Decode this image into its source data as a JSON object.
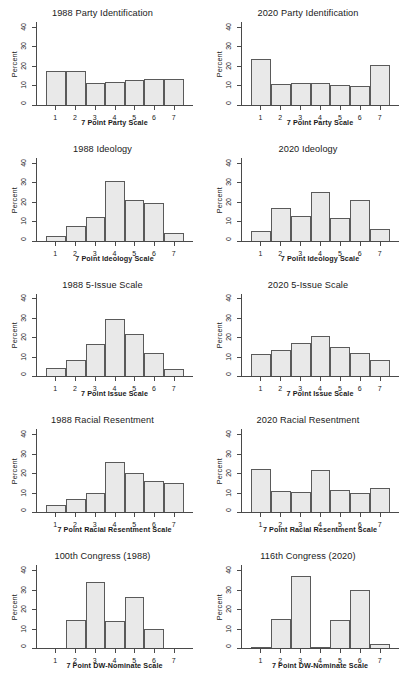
{
  "figure": {
    "ylabel": "Percent",
    "yticks": [
      0,
      10,
      20,
      30,
      40
    ],
    "ylim": [
      0,
      43
    ],
    "xticks": [
      1,
      2,
      3,
      4,
      5,
      6,
      7
    ],
    "bar_fill": "#e9e9e9",
    "bar_border": "#5a5a5a",
    "background": "#ffffff"
  },
  "chart_data": [
    {
      "type": "bar",
      "title": "1988 Party Identification",
      "xlabel": "7 Point Party Scale",
      "ylabel": "Percent",
      "categories": [
        1,
        2,
        3,
        4,
        5,
        6,
        7
      ],
      "values": [
        17.5,
        17.4,
        11.5,
        11.6,
        13.0,
        13.5,
        13.4
      ],
      "ylim": [
        0,
        43
      ],
      "grid": false,
      "legend": "none"
    },
    {
      "type": "bar",
      "title": "2020 Party Identification",
      "xlabel": "7 Point Party Scale",
      "ylabel": "Percent",
      "categories": [
        1,
        2,
        3,
        4,
        5,
        6,
        7
      ],
      "values": [
        23.6,
        11.0,
        11.5,
        11.4,
        10.5,
        9.8,
        20.6
      ],
      "ylim": [
        0,
        43
      ],
      "grid": false,
      "legend": "none"
    },
    {
      "type": "bar",
      "title": "1988 Ideology",
      "xlabel": "7 Point Ideology Scale",
      "ylabel": "Percent",
      "categories": [
        1,
        2,
        3,
        4,
        5,
        6,
        7
      ],
      "values": [
        2.2,
        7.6,
        12.5,
        31.0,
        21.3,
        19.4,
        4.0
      ],
      "ylim": [
        0,
        43
      ],
      "grid": false,
      "legend": "none"
    },
    {
      "type": "bar",
      "title": "2020 Ideology",
      "xlabel": "7 Point Ideology Scale",
      "ylabel": "Percent",
      "categories": [
        1,
        2,
        3,
        4,
        5,
        6,
        7
      ],
      "values": [
        5.2,
        17.1,
        12.7,
        25.5,
        11.5,
        21.0,
        6.0
      ],
      "ylim": [
        0,
        43
      ],
      "grid": false,
      "legend": "none"
    },
    {
      "type": "bar",
      "title": "1988 5-Issue Scale",
      "xlabel": "7 Point Issue Scale",
      "ylabel": "Percent",
      "categories": [
        1,
        2,
        3,
        4,
        5,
        6,
        7
      ],
      "values": [
        4.3,
        8.6,
        17.0,
        30.0,
        22.2,
        12.1,
        3.8
      ],
      "ylim": [
        0,
        43
      ],
      "grid": false,
      "legend": "none"
    },
    {
      "type": "bar",
      "title": "2020 5-Issue Scale",
      "xlabel": "7 Point Issue Scale",
      "ylabel": "Percent",
      "categories": [
        1,
        2,
        3,
        4,
        5,
        6,
        7
      ],
      "values": [
        11.4,
        13.8,
        17.2,
        21.2,
        15.5,
        12.1,
        8.3
      ],
      "ylim": [
        0,
        43
      ],
      "grid": false,
      "legend": "none"
    },
    {
      "type": "bar",
      "title": "1988 Racial Resentment",
      "xlabel": "7 Point Racial Resentment Scale",
      "ylabel": "Percent",
      "categories": [
        1,
        2,
        3,
        4,
        5,
        6,
        7
      ],
      "values": [
        3.6,
        6.8,
        10.2,
        26.0,
        20.5,
        16.3,
        15.4
      ],
      "ylim": [
        0,
        43
      ],
      "grid": false,
      "legend": "none"
    },
    {
      "type": "bar",
      "title": "2020 Racial Resentment",
      "xlabel": "7 Point Racial Resentment Scale",
      "ylabel": "Percent",
      "categories": [
        1,
        2,
        3,
        4,
        5,
        6,
        7
      ],
      "values": [
        22.6,
        11.2,
        10.4,
        21.7,
        11.3,
        10.0,
        12.8
      ],
      "ylim": [
        0,
        43
      ],
      "grid": false,
      "legend": "none"
    },
    {
      "type": "bar",
      "title": "100th Congress (1988)",
      "xlabel": "7 Point DW-Nominate Scale",
      "ylabel": "Percent",
      "categories": [
        1,
        2,
        3,
        4,
        5,
        6,
        7
      ],
      "values": [
        0.0,
        14.3,
        34.2,
        14.2,
        26.6,
        10.1,
        0.0
      ],
      "ylim": [
        0,
        43
      ],
      "grid": false,
      "legend": "none"
    },
    {
      "type": "bar",
      "title": "116th Congress (2020)",
      "xlabel": "7 Point DW-Nominate Scale",
      "ylabel": "Percent",
      "categories": [
        1,
        2,
        3,
        4,
        5,
        6,
        7
      ],
      "values": [
        0.2,
        15.0,
        37.3,
        0.5,
        14.3,
        29.9,
        2.0
      ],
      "ylim": [
        0,
        43
      ],
      "grid": false,
      "legend": "none"
    }
  ]
}
